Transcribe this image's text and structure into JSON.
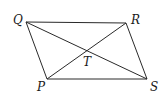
{
  "figure": {
    "type": "parallelogram-with-diagonals",
    "vertices": [
      {
        "name": "Q",
        "x": 26,
        "y": 22,
        "label_x": 13,
        "label_y": 24
      },
      {
        "name": "R",
        "x": 126,
        "y": 23,
        "label_x": 131,
        "label_y": 24
      },
      {
        "name": "S",
        "x": 147,
        "y": 79,
        "label_x": 150,
        "label_y": 91
      },
      {
        "name": "P",
        "x": 47,
        "y": 79,
        "label_x": 37,
        "label_y": 91
      }
    ],
    "intersection": {
      "name": "T",
      "x": 87,
      "y": 51,
      "label_x": 83,
      "label_y": 66
    },
    "edges": [
      [
        "Q",
        "R"
      ],
      [
        "R",
        "S"
      ],
      [
        "S",
        "P"
      ],
      [
        "P",
        "Q"
      ]
    ],
    "diagonals": [
      [
        "Q",
        "S"
      ],
      [
        "P",
        "R"
      ]
    ],
    "line_color": "#2a2a2a",
    "label_color": "#1a1a1a"
  }
}
